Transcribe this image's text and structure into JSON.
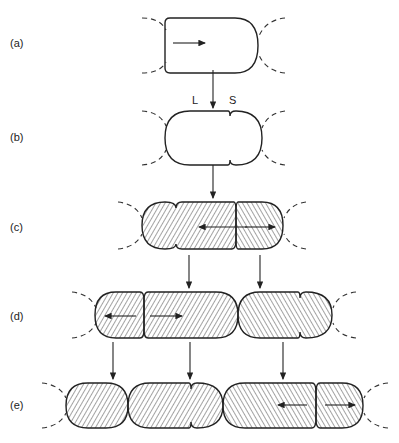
{
  "figure": {
    "rows": [
      {
        "id": "a",
        "label": "(a)"
      },
      {
        "id": "b",
        "label": "(b)",
        "pole_labels": {
          "left": "L",
          "right": "S"
        }
      },
      {
        "id": "c",
        "label": "(c)"
      },
      {
        "id": "d",
        "label": "(d)"
      },
      {
        "id": "e",
        "label": "(e)"
      }
    ],
    "colors": {
      "stroke": "#222222",
      "background": "#ffffff"
    }
  }
}
